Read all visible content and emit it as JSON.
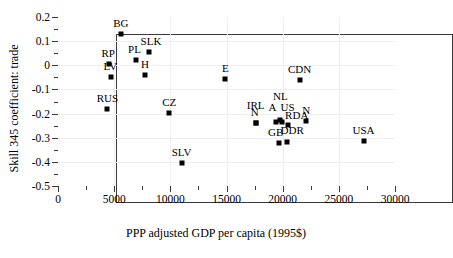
{
  "chart_data": {
    "type": "scatter",
    "title": "",
    "xlabel": "PPP adjusted GDP per capita (1995$)",
    "ylabel": "Skill 345 coefficient: trade",
    "xlim": [
      0,
      30000
    ],
    "ylim": [
      -0.5,
      0.2
    ],
    "xticks": [
      0,
      5000,
      10000,
      15000,
      20000,
      25000,
      30000
    ],
    "xtick_labels": [
      "0",
      "5000",
      "10000",
      "15000",
      "20000",
      "25000",
      "30000"
    ],
    "yticks": [
      0.2,
      0.1,
      0,
      -0.1,
      -0.2,
      -0.3,
      -0.4,
      -0.5
    ],
    "ytick_labels": [
      "0.2",
      "0.1",
      "0",
      "-0.1",
      "-0.2",
      "-0.3",
      "-0.4",
      "-0.5"
    ],
    "x_minor_ticks": [
      2500,
      7500,
      12500,
      17500,
      22500,
      27500
    ],
    "y_minor_ticks": [
      0.15,
      0.05,
      -0.05,
      -0.15,
      -0.25,
      -0.35,
      -0.45
    ],
    "grid": true,
    "legend": null,
    "marker": "square",
    "marker_color": "#000000",
    "points": [
      {
        "label": "BG",
        "x": 5600,
        "y": 0.13,
        "label_dx": 0,
        "label_dy": -5
      },
      {
        "label": "SLK",
        "x": 8100,
        "y": 0.055,
        "label_dx": 2,
        "label_dy": -5
      },
      {
        "label": "PL",
        "x": 6900,
        "y": 0.021,
        "label_dx": -1,
        "label_dy": -5
      },
      {
        "label": "RP",
        "x": 4550,
        "y": 0.006,
        "label_dx": -1,
        "label_dy": -5
      },
      {
        "label": "LV",
        "x": 4750,
        "y": -0.047,
        "label_dx": -1,
        "label_dy": -5
      },
      {
        "label": "H",
        "x": 7750,
        "y": -0.042,
        "label_dx": 0,
        "label_dy": -5
      },
      {
        "label": "E",
        "x": 14900,
        "y": -0.057,
        "label_dx": 0,
        "label_dy": -5
      },
      {
        "label": "CDN",
        "x": 21500,
        "y": -0.06,
        "label_dx": 0,
        "label_dy": -5
      },
      {
        "label": "RUS",
        "x": 4400,
        "y": -0.182,
        "label_dx": 0,
        "label_dy": -5
      },
      {
        "label": "CZ",
        "x": 9900,
        "y": -0.196,
        "label_dx": 0,
        "label_dy": -5
      },
      {
        "label": "NL",
        "x": 19800,
        "y": -0.228,
        "label_dx": 0,
        "label_dy": -18
      },
      {
        "label": "IRL",
        "x": 17600,
        "y": -0.237,
        "label_dx": 0,
        "label_dy": -12
      },
      {
        "label": "N",
        "x": 17600,
        "y": -0.237,
        "label_dx": -1,
        "label_dy": -5
      },
      {
        "label": "A",
        "x": 19450,
        "y": -0.234,
        "label_dx": -4,
        "label_dy": -9
      },
      {
        "label": "US",
        "x": 19900,
        "y": -0.234,
        "label_dx": 6,
        "label_dy": -9
      },
      {
        "label": "RDA",
        "x": 20450,
        "y": -0.248,
        "label_dx": 9,
        "label_dy": -4
      },
      {
        "label": "N2",
        "x": 22100,
        "y": -0.232,
        "label_dx": 0,
        "label_dy": -5,
        "display": "N"
      },
      {
        "label": "GB",
        "x": 19650,
        "y": -0.32,
        "label_dx": -3,
        "label_dy": -5
      },
      {
        "label": "DDR",
        "x": 20400,
        "y": -0.318,
        "label_dx": 5,
        "label_dy": -6
      },
      {
        "label": "USA",
        "x": 27200,
        "y": -0.312,
        "label_dx": 0,
        "label_dy": -5
      },
      {
        "label": "SLV",
        "x": 11000,
        "y": -0.403,
        "label_dx": 0,
        "label_dy": -5
      }
    ]
  }
}
